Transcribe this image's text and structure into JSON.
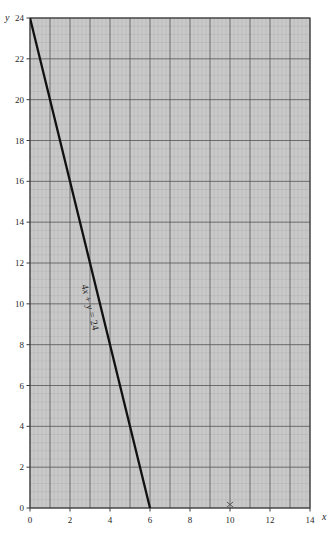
{
  "chart_data": {
    "type": "line",
    "title": "",
    "subtitle": "",
    "xlabel": "x",
    "ylabel": "y",
    "xlim": [
      0,
      14
    ],
    "ylim": [
      0,
      24
    ],
    "xticks": [
      0,
      2,
      4,
      6,
      8,
      10,
      12,
      14
    ],
    "xticklabels": [
      "0",
      "2",
      "4",
      "6",
      "8",
      "10",
      "12",
      "14"
    ],
    "yticks": [
      0,
      2,
      4,
      6,
      8,
      10,
      12,
      14,
      16,
      18,
      20,
      22,
      24
    ],
    "yticklabels": [
      "0",
      "2",
      "4",
      "6",
      "8",
      "10",
      "12",
      "14",
      "16",
      "18",
      "20",
      "22",
      "24"
    ],
    "grid": true,
    "grid_major_step_x": 1,
    "grid_major_step_y": 2,
    "grid_minor_divisions": 5,
    "legend": null,
    "series": [
      {
        "name": "4x + y = 24",
        "equation": "4x + y = 24",
        "type": "line",
        "color": "#111111",
        "x": [
          0,
          6
        ],
        "y": [
          24,
          0
        ],
        "x_intercept": 6,
        "y_intercept": 24,
        "slope": -4
      }
    ],
    "annotations": [
      {
        "text": "4x + y = 24",
        "text_parts": {
          "coefficient": "4",
          "var_x": "x",
          "plus": " + ",
          "var_y": "y",
          "equals": " = ",
          "constant": "24"
        },
        "x": 3.0,
        "y": 11.0,
        "rotation_deg": 76,
        "along_line": true
      },
      {
        "text": "x",
        "kind": "tick-artifact-mark",
        "x": 10,
        "y": 0
      }
    ]
  },
  "axes": {
    "y_axis_name": "y",
    "x_axis_name": "x"
  },
  "colors": {
    "plot_background": "#c9c9c9",
    "grid_major": "#545454",
    "grid_minor": "#b0b0b0",
    "axis_line": "#3b3b3b",
    "data_line": "#111111",
    "text": "#272727",
    "page_background": "#ffffff"
  },
  "geometry": {
    "plot_left_px": 30,
    "plot_right_px": 310,
    "plot_top_px": 18,
    "plot_bottom_px": 508
  }
}
